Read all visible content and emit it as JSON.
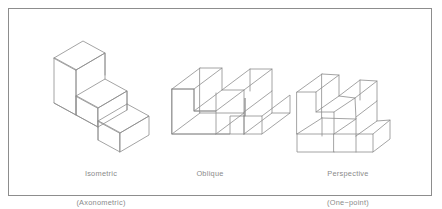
{
  "figure": {
    "background_color": "#ffffff",
    "frame": {
      "border_color": "#8d8d8d",
      "fill_color": "#ffffff"
    },
    "line_color": "#8d8d8d",
    "text_color": "#8a8a8a",
    "object_described": "two-step staircase block"
  },
  "captions": {
    "isometric": {
      "line1": "Isometric",
      "line2": "(Axonometric)"
    },
    "oblique": {
      "line1": "Oblique",
      "line2": ""
    },
    "perspective": {
      "line1": "Perspective",
      "line2": "(One−point)"
    }
  },
  "figures": [
    {
      "id": "isometric",
      "name": "Isometric projection of step block"
    },
    {
      "id": "oblique",
      "name": "Oblique projection of step block"
    },
    {
      "id": "perspective",
      "name": "One-point perspective of step block"
    }
  ]
}
